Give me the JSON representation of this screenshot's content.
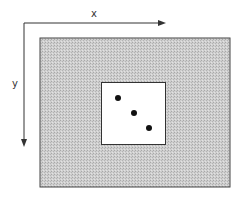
{
  "diagram": {
    "type": "coordinate-frame",
    "x_axis": {
      "label": "x",
      "direction": "right"
    },
    "y_axis": {
      "label": "y",
      "direction": "down"
    },
    "outer_region": {
      "fill": "#c8c8c8",
      "pattern": "stippled-gray",
      "border": "#444444"
    },
    "inner_window": {
      "fill": "#ffffff",
      "border": "#333333"
    },
    "points": [
      {
        "x": 118,
        "y": 98
      },
      {
        "x": 134,
        "y": 113
      },
      {
        "x": 149,
        "y": 128
      }
    ],
    "colors": {
      "axis": "#333333",
      "point": "#111111"
    }
  }
}
